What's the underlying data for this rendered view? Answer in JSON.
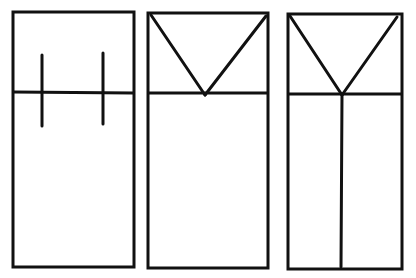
{
  "diagram": {
    "stroke_color": "#111111",
    "background": "#ffffff",
    "panels": [
      {
        "id": "panel-1",
        "rect": {
          "x": 13,
          "y": 12,
          "w": 121,
          "h": 255
        },
        "lines": [
          {
            "name": "horizontal-divider",
            "x1": 14,
            "y1": 92,
            "x2": 133,
            "y2": 93
          },
          {
            "name": "left-tick",
            "x1": 42,
            "y1": 55,
            "x2": 42,
            "y2": 126
          },
          {
            "name": "right-tick",
            "x1": 103,
            "y1": 53,
            "x2": 103,
            "y2": 124
          }
        ]
      },
      {
        "id": "panel-2",
        "rect": {
          "x": 148,
          "y": 13,
          "w": 120,
          "h": 255
        },
        "lines": [
          {
            "name": "horizontal-divider",
            "x1": 149,
            "y1": 93,
            "x2": 267,
            "y2": 93
          },
          {
            "name": "v-left-arm",
            "x1": 151,
            "y1": 15,
            "x2": 205,
            "y2": 95
          },
          {
            "name": "v-right-arm",
            "x1": 266,
            "y1": 16,
            "x2": 205,
            "y2": 95
          }
        ]
      },
      {
        "id": "panel-3",
        "rect": {
          "x": 288,
          "y": 14,
          "w": 114,
          "h": 255
        },
        "lines": [
          {
            "name": "horizontal-divider",
            "x1": 289,
            "y1": 94,
            "x2": 401,
            "y2": 94
          },
          {
            "name": "v-left-arm",
            "x1": 290,
            "y1": 16,
            "x2": 342,
            "y2": 95
          },
          {
            "name": "v-right-arm",
            "x1": 397,
            "y1": 17,
            "x2": 342,
            "y2": 95
          },
          {
            "name": "center-vertical",
            "x1": 342,
            "y1": 95,
            "x2": 341,
            "y2": 267
          }
        ]
      }
    ]
  }
}
